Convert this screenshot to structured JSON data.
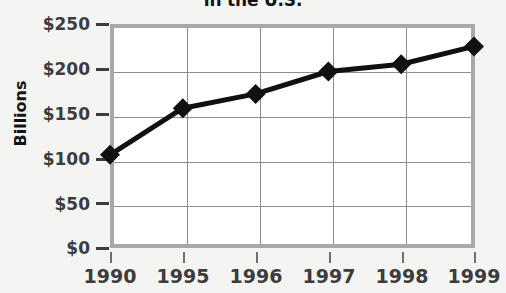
{
  "chart_data": {
    "type": "line",
    "title": "in the U.S.",
    "xlabel": "",
    "ylabel": "Billions",
    "categories": [
      "1990",
      "1995",
      "1996",
      "1997",
      "1998",
      "1999"
    ],
    "values": [
      104,
      156,
      172,
      197,
      205,
      225
    ],
    "series": [
      {
        "name": "Value",
        "values": [
          104,
          156,
          172,
          197,
          205,
          225
        ]
      }
    ],
    "ylim": [
      0,
      250
    ],
    "y_ticks": [
      0,
      50,
      100,
      150,
      200,
      250
    ],
    "y_tick_labels": [
      "$0",
      "$50",
      "$100",
      "$150",
      "$200",
      "$250"
    ],
    "x_tick_labels": [
      "1990",
      "1995",
      "1996",
      "1997",
      "1998",
      "1999"
    ],
    "grid": true,
    "legend": "none",
    "marker": "diamond",
    "line_color": "#111111",
    "marker_color": "#111111",
    "grid_color": "#8e8e8e",
    "frame_color": "#a8a8a8",
    "plot_background": "#ffffff",
    "page_background": "#f4f4f2",
    "text_color": "#3c3c3c"
  },
  "labels": {
    "y_axis_title": "Billions",
    "chart_title": "in the U.S."
  }
}
